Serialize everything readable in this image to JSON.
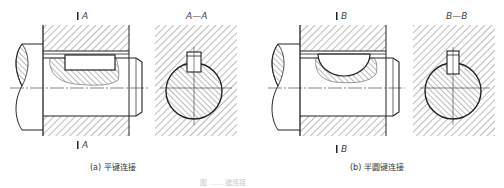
{
  "figure": {
    "caption": "图 …… 键连接",
    "panels": [
      {
        "id": "a",
        "section_marker": "A",
        "section_title": "A—A",
        "caption": "(a) 平键连接",
        "key_type": "flat-key"
      },
      {
        "id": "b",
        "section_marker": "B",
        "section_title": "B—B",
        "caption": "(b) 半圆键连接",
        "key_type": "woodruff-key"
      }
    ],
    "colors": {
      "line": "#222222",
      "hatch": "#555555",
      "background": "#ffffff"
    }
  }
}
